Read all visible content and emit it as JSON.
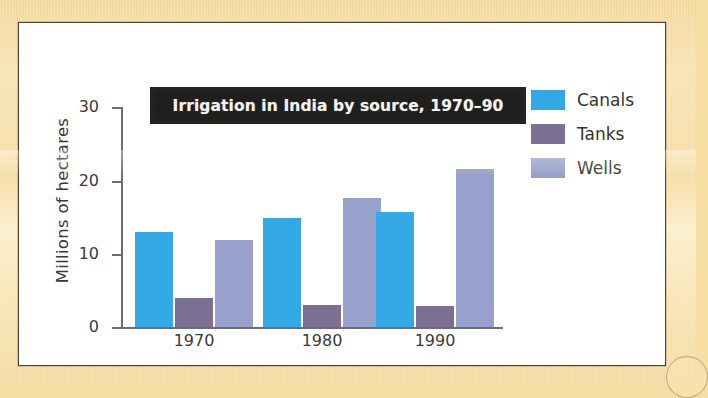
{
  "chart_data": {
    "type": "bar",
    "title": "Irrigation in India by source, 1970–90",
    "xlabel": "",
    "ylabel": "Millions of hectares",
    "categories": [
      "1970",
      "1980",
      "1990"
    ],
    "series": [
      {
        "name": "Canals",
        "color": "#34a8e4",
        "values": [
          12.9,
          14.8,
          15.7
        ]
      },
      {
        "name": "Tanks",
        "color": "#7b6f93",
        "values": [
          4.0,
          3.0,
          2.9
        ]
      },
      {
        "name": "Wells",
        "color": "#98a1cb",
        "values": [
          11.8,
          17.6,
          21.6
        ]
      }
    ],
    "ylim": [
      0,
      30
    ],
    "yticks": [
      "0",
      "10",
      "20",
      "30"
    ],
    "grid": false,
    "legend_position": "right"
  },
  "legend": {
    "rows": [
      {
        "label": "Canals"
      },
      {
        "label": "Tanks"
      },
      {
        "label": "Wells"
      }
    ]
  },
  "axis": {
    "y_title": "Millions of hectares",
    "ticks": [
      "30",
      "20",
      "10",
      "0"
    ]
  },
  "banner": {
    "text": "Irrigation in India by source, 1970–90"
  }
}
